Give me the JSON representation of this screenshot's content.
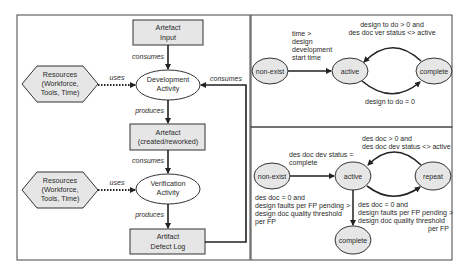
{
  "colors": {
    "node_fill": "#e6e6e6",
    "stroke": "#333333",
    "panel_border": "#444444",
    "background": "#ffffff"
  },
  "left_panel": {
    "artefact_input": {
      "line1": "Artefact",
      "line2": "Input"
    },
    "dev_activity": {
      "line1": "Development",
      "line2": "Activity"
    },
    "resources_1": {
      "line1": "Resources",
      "line2": "(Workforce,",
      "line3": "Tools, Time)"
    },
    "resources_2": {
      "line1": "Resources",
      "line2": "(Workforce,",
      "line3": "Tools, Time)"
    },
    "artefact_created": {
      "line1": "Artefact",
      "line2": "(created/reworked)"
    },
    "verif_activity": {
      "line1": "Verification",
      "line2": "Activity"
    },
    "defect_log": {
      "line1": "Artifact",
      "line2": "Defect Log"
    },
    "edges": {
      "consumes_input": "consumes",
      "uses_1": "uses",
      "produces_artefact": "produces",
      "consumes_artefact": "consumes",
      "uses_2": "uses",
      "produces_log": "produces",
      "consumes_log": "consumes"
    }
  },
  "top_right_panel": {
    "states": {
      "non_exist": "non-exist",
      "active": "active",
      "complete": "complete"
    },
    "transitions": {
      "nonexist_to_active": [
        "time >",
        "design",
        "development",
        "start time"
      ],
      "complete_to_active": [
        "design to do > 0 and",
        "des doc ver status <> active"
      ],
      "active_to_complete": [
        "design to do = 0"
      ]
    }
  },
  "bottom_right_panel": {
    "states": {
      "non_exist": "non-exist",
      "active": "active",
      "repeat": "repeat",
      "complete": "complete"
    },
    "transitions": {
      "nonexist_to_active": [
        "des doc dev status =",
        "complete"
      ],
      "repeat_to_active": [
        "des doc > 0 and",
        "des doc dev status <> active"
      ],
      "active_to_repeat": [
        "des doc = 0 and",
        "design faults per FP pending >",
        "design doc quality threshold",
        "per FP"
      ],
      "active_to_complete": [
        "des doc = 0 and",
        "design faults per FP pending >",
        "design doc quality threshold",
        "per FP"
      ]
    }
  }
}
